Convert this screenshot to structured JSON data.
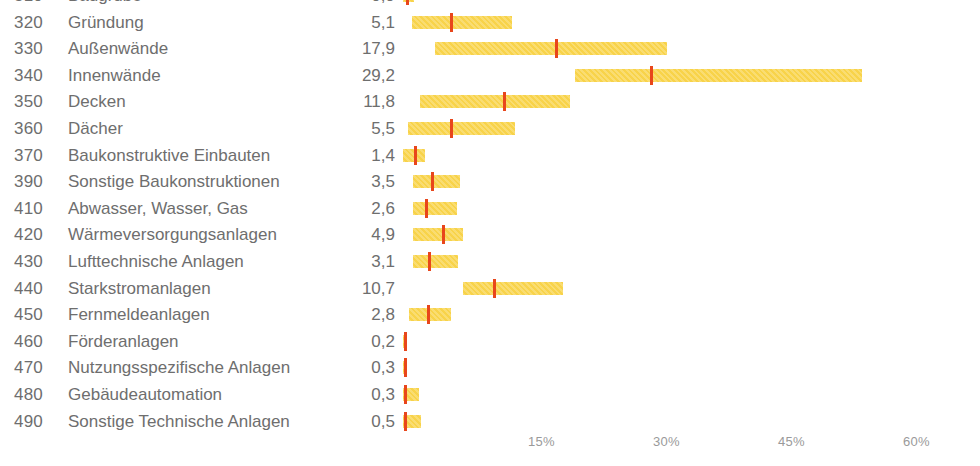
{
  "chart_data": {
    "type": "bar",
    "subtype": "floating-range-bar-with-median-marker",
    "title": "",
    "xlabel": "",
    "ylabel": "",
    "xlim": [
      0,
      60
    ],
    "xunit": "%",
    "grid": false,
    "legend": null,
    "axis_ticks": [
      {
        "label": "15%",
        "value": 15,
        "x": 528
      },
      {
        "label": "30%",
        "value": 30,
        "x": 653
      },
      {
        "label": "45%",
        "value": 45,
        "x": 778
      },
      {
        "label": "60%",
        "value": 60,
        "x": 903
      }
    ],
    "colors": {
      "range_bar": "#f8d34a",
      "median_marker": "#e8461b",
      "text": "#6e6e6e",
      "axis_text": "#9a9a9a",
      "background": "#ffffff"
    },
    "categories": [
      {
        "code": "310",
        "label": "Baugrube",
        "value": "0,9",
        "value_num": 0.9,
        "range_low": 0.0,
        "range_high": 1.3,
        "median": 0.3,
        "clipped_top": true
      },
      {
        "code": "320",
        "label": "Gründung",
        "value": "5,1",
        "value_num": 5.1,
        "range_low": 1.1,
        "range_high": 13.1,
        "median": 5.6
      },
      {
        "code": "330",
        "label": "Außenwände",
        "value": "17,9",
        "value_num": 17.9,
        "range_low": 3.8,
        "range_high": 31.7,
        "median": 18.2
      },
      {
        "code": "340",
        "label": "Innenwände",
        "value": "29,2",
        "value_num": 29.2,
        "range_low": 20.6,
        "range_high": 55.1,
        "median": 29.6
      },
      {
        "code": "350",
        "label": "Decken",
        "value": "11,8",
        "value_num": 11.8,
        "range_low": 2.0,
        "range_high": 20.0,
        "median": 12.0
      },
      {
        "code": "360",
        "label": "Dächer",
        "value": "5,5",
        "value_num": 5.5,
        "range_low": 0.6,
        "range_high": 13.4,
        "median": 5.6
      },
      {
        "code": "370",
        "label": "Baukonstruktive Einbauten",
        "value": "1,4",
        "value_num": 1.4,
        "range_low": 0.0,
        "range_high": 2.6,
        "median": 1.3
      },
      {
        "code": "390",
        "label": "Sonstige Baukonstruktionen",
        "value": "3,5",
        "value_num": 3.5,
        "range_low": 1.2,
        "range_high": 6.8,
        "median": 3.4
      },
      {
        "code": "410",
        "label": "Abwasser, Wasser, Gas",
        "value": "2,6",
        "value_num": 2.6,
        "range_low": 1.2,
        "range_high": 6.5,
        "median": 2.6
      },
      {
        "code": "420",
        "label": "Wärmeversorgungsanlagen",
        "value": "4,9",
        "value_num": 4.9,
        "range_low": 1.2,
        "range_high": 7.2,
        "median": 4.7
      },
      {
        "code": "430",
        "label": "Lufttechnische Anlagen",
        "value": "3,1",
        "value_num": 3.1,
        "range_low": 1.2,
        "range_high": 6.6,
        "median": 3.0
      },
      {
        "code": "440",
        "label": "Starkstromanlagen",
        "value": "10,7",
        "value_num": 10.7,
        "range_low": 7.2,
        "range_high": 19.2,
        "median": 10.8
      },
      {
        "code": "450",
        "label": "Fernmeldeanlagen",
        "value": "2,8",
        "value_num": 2.8,
        "range_low": 0.7,
        "range_high": 5.8,
        "median": 2.9
      },
      {
        "code": "460",
        "label": "Förderanlagen",
        "value": "0,2",
        "value_num": 0.2,
        "range_low": 0.0,
        "range_high": 0.2,
        "median": 0.1
      },
      {
        "code": "470",
        "label": "Nutzungsspezifische Anlagen",
        "value": "0,3",
        "value_num": 0.3,
        "range_low": 0.0,
        "range_high": 0.3,
        "median": 0.1
      },
      {
        "code": "480",
        "label": "Gebäudeautomation",
        "value": "0,3",
        "value_num": 0.3,
        "range_low": 0.0,
        "range_high": 1.9,
        "median": 0.1
      },
      {
        "code": "490",
        "label": "Sonstige Technische Anlagen",
        "value": "0,5",
        "value_num": 0.5,
        "range_low": 0.0,
        "range_high": 2.2,
        "median": 0.1
      }
    ]
  },
  "footnote": ""
}
